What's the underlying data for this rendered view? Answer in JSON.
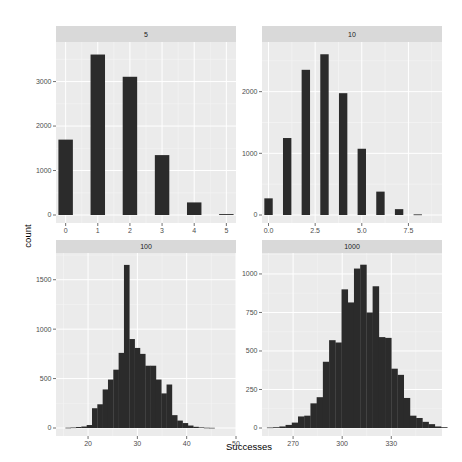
{
  "chart_data": {
    "type": "bar",
    "layout": "facet_wrap 2x2, free scales",
    "xlabel": "Successes",
    "ylabel": "count",
    "grid": true,
    "panels": [
      {
        "title": "5",
        "kind": "bar",
        "x": [
          0,
          1,
          2,
          3,
          4,
          5
        ],
        "values": [
          1695,
          3608,
          3108,
          1347,
          283,
          20
        ],
        "xlim": [
          -0.3,
          5.3
        ],
        "ylim": [
          0,
          3800
        ],
        "xticks": [
          0,
          1,
          2,
          3,
          4,
          5
        ],
        "xtick_labels": [
          "0",
          "1",
          "2",
          "3",
          "4",
          "5"
        ],
        "yticks": [
          0,
          1000,
          2000,
          3000
        ],
        "ytick_labels": [
          "0",
          "1000",
          "2000",
          "3000"
        ]
      },
      {
        "title": "10",
        "kind": "bar",
        "x": [
          0,
          1,
          2,
          3,
          4,
          5,
          6,
          7,
          8
        ],
        "values": [
          270,
          1248,
          2354,
          2606,
          1975,
          1074,
          379,
          95,
          10
        ],
        "xlim": [
          -0.35,
          9.3
        ],
        "ylim": [
          0,
          2740
        ],
        "xticks": [
          0,
          2.5,
          5,
          7.5
        ],
        "xtick_labels": [
          "0.0",
          "2.5",
          "5.0",
          "7.5"
        ],
        "yticks": [
          0,
          1000,
          2000
        ],
        "ytick_labels": [
          "0",
          "1000",
          "2000"
        ]
      },
      {
        "title": "100",
        "kind": "histogram",
        "bin_start": 15.4,
        "bin_width": 1.08,
        "values": [
          3,
          5,
          10,
          15,
          30,
          200,
          240,
          390,
          490,
          590,
          760,
          1650,
          900,
          810,
          750,
          630,
          630,
          490,
          350,
          440,
          130,
          75,
          50,
          25,
          12,
          6,
          3,
          2
        ],
        "xlim": [
          13.5,
          50
        ],
        "ylim": [
          0,
          1730
        ],
        "xticks": [
          20,
          30,
          40,
          50
        ],
        "xtick_labels": [
          "20",
          "30",
          "40",
          "50"
        ],
        "yticks": [
          0,
          500,
          1000,
          1500
        ],
        "ytick_labels": [
          "0",
          "500",
          "1000",
          "1500"
        ]
      },
      {
        "title": "1000",
        "kind": "histogram",
        "bin_start": 254,
        "bin_width": 3.8,
        "values": [
          3,
          5,
          10,
          20,
          35,
          75,
          80,
          160,
          200,
          430,
          570,
          555,
          900,
          815,
          1035,
          1060,
          750,
          920,
          590,
          585,
          385,
          345,
          195,
          80,
          65,
          40,
          25,
          10,
          5
        ],
        "xlim": [
          251,
          361
        ],
        "ylim": [
          0,
          1110
        ],
        "xticks": [
          270,
          300,
          330
        ],
        "xtick_labels": [
          "270",
          "300",
          "330"
        ],
        "yticks": [
          0,
          250,
          500,
          750,
          1000
        ],
        "ytick_labels": [
          "0",
          "250",
          "500",
          "750",
          "1000"
        ]
      }
    ]
  },
  "colors": {
    "panel_bg": "#ebebeb",
    "strip_bg": "#d9d9d9",
    "grid_major": "#ffffff",
    "grid_minor": "#f5f5f5",
    "bar_fill": "#2b2b2b",
    "tick": "#4d4d4d"
  }
}
